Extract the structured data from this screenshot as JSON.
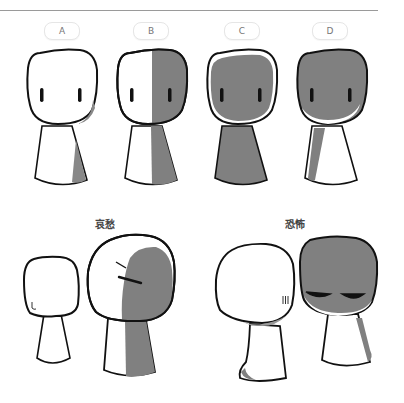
{
  "panels": [
    {
      "label": "A",
      "shading": "none"
    },
    {
      "label": "B",
      "shading": "right-half"
    },
    {
      "label": "C",
      "shading": "full-with-rim"
    },
    {
      "label": "D",
      "shading": "full-with-lower-rim"
    }
  ],
  "examples": [
    {
      "caption": "哀愁",
      "description": "sad: small figure plus larger figure shaded on right with slanted brows"
    },
    {
      "caption": "恐怖",
      "description": "fear: white head with stress lines plus dark-shaded head with half-closed eyes"
    }
  ],
  "colors": {
    "outline": "#111111",
    "shade": "#808080",
    "fill": "#ffffff"
  }
}
